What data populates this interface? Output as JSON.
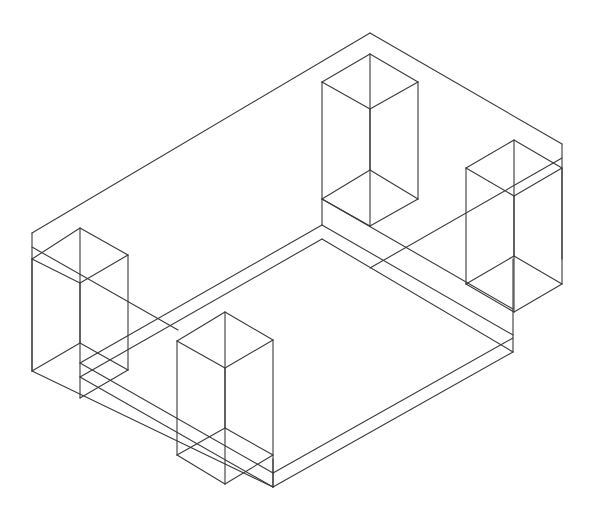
{
  "diagram": {
    "type": "isometric-wireframe",
    "stroke_color": "#3a3a3a",
    "background": "#ffffff",
    "groups": [
      {
        "name": "outer-box",
        "lines": [
          [
            32,
            233,
            370,
            33
          ],
          [
            370,
            33,
            562,
            144
          ],
          [
            32,
            233,
            32,
            371
          ],
          [
            562,
            144,
            562,
            259
          ],
          [
            32,
            371,
            273,
            487
          ],
          [
            273,
            487,
            513,
            352
          ],
          [
            273,
            487,
            273,
            459
          ],
          [
            513,
            352,
            513,
            259
          ],
          [
            32,
            247,
            178,
            330
          ],
          [
            562,
            158,
            370,
            268
          ]
        ]
      },
      {
        "name": "inner-floor",
        "lines": [
          [
            80,
            363,
            322,
            225
          ],
          [
            322,
            225,
            513,
            335
          ],
          [
            80,
            377,
            322,
            239
          ],
          [
            80,
            377,
            273,
            487
          ],
          [
            80,
            363,
            273,
            473
          ],
          [
            273,
            473,
            513,
            338
          ],
          [
            322,
            239,
            513,
            352
          ],
          [
            322,
            199,
            322,
            225
          ],
          [
            322,
            199,
            513,
            309
          ]
        ]
      },
      {
        "name": "post-front-left",
        "lines": [
          [
            32,
            259,
            80,
            228
          ],
          [
            80,
            228,
            128,
            255
          ],
          [
            128,
            255,
            80,
            283
          ],
          [
            80,
            283,
            32,
            259
          ],
          [
            32,
            259,
            32,
            371
          ],
          [
            80,
            283,
            80,
            398
          ],
          [
            128,
            255,
            128,
            370
          ],
          [
            80,
            228,
            80,
            343
          ],
          [
            32,
            371,
            80,
            343
          ],
          [
            80,
            343,
            128,
            370
          ],
          [
            128,
            370,
            80,
            398
          ]
        ]
      },
      {
        "name": "post-front-right",
        "lines": [
          [
            177,
            341,
            225,
            312
          ],
          [
            225,
            312,
            273,
            340
          ],
          [
            273,
            340,
            225,
            368
          ],
          [
            225,
            368,
            177,
            341
          ],
          [
            177,
            341,
            177,
            455
          ],
          [
            225,
            368,
            225,
            484
          ],
          [
            273,
            340,
            273,
            487
          ],
          [
            225,
            312,
            225,
            428
          ],
          [
            177,
            455,
            225,
            428
          ],
          [
            225,
            428,
            273,
            455
          ],
          [
            177,
            455,
            225,
            484
          ],
          [
            225,
            484,
            273,
            455
          ]
        ]
      },
      {
        "name": "post-back-left",
        "lines": [
          [
            322,
            82,
            370,
            54
          ],
          [
            370,
            54,
            418,
            82
          ],
          [
            418,
            82,
            370,
            109
          ],
          [
            370,
            109,
            322,
            82
          ],
          [
            322,
            82,
            322,
            199
          ],
          [
            370,
            109,
            370,
            226
          ],
          [
            418,
            82,
            418,
            199
          ],
          [
            370,
            54,
            370,
            170
          ],
          [
            322,
            199,
            370,
            170
          ],
          [
            370,
            170,
            418,
            199
          ],
          [
            322,
            199,
            370,
            226
          ],
          [
            370,
            226,
            418,
            199
          ]
        ]
      },
      {
        "name": "post-back-right",
        "lines": [
          [
            466,
            168,
            514,
            140
          ],
          [
            514,
            140,
            562,
            168
          ],
          [
            562,
            168,
            514,
            196
          ],
          [
            514,
            196,
            466,
            168
          ],
          [
            466,
            168,
            466,
            284
          ],
          [
            514,
            196,
            514,
            312
          ],
          [
            562,
            168,
            562,
            284
          ],
          [
            514,
            140,
            514,
            256
          ],
          [
            466,
            284,
            514,
            256
          ],
          [
            514,
            256,
            562,
            284
          ],
          [
            466,
            284,
            514,
            312
          ],
          [
            514,
            312,
            562,
            284
          ]
        ]
      }
    ]
  }
}
